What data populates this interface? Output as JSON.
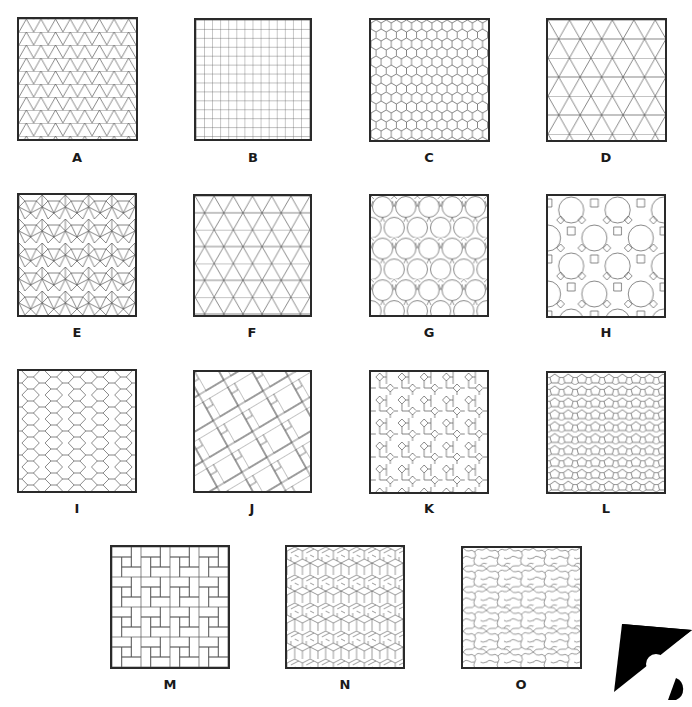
{
  "figure": {
    "title": "",
    "panels": [
      {
        "id": "A",
        "label": "A",
        "pattern": "triangular-grid-dense",
        "box": [
          17,
          17,
          121,
          124
        ]
      },
      {
        "id": "B",
        "label": "B",
        "pattern": "square-grid",
        "box": [
          194,
          18,
          118,
          123
        ]
      },
      {
        "id": "C",
        "label": "C",
        "pattern": "hexagonal",
        "box": [
          369,
          18,
          121,
          124
        ]
      },
      {
        "id": "D",
        "label": "D",
        "pattern": "trihexagonal-large",
        "box": [
          546,
          18,
          121,
          124
        ]
      },
      {
        "id": "E",
        "label": "E",
        "pattern": "snub-square",
        "box": [
          17,
          193,
          120,
          124
        ]
      },
      {
        "id": "F",
        "label": "F",
        "pattern": "trihexagonal",
        "box": [
          193,
          194,
          119,
          123
        ]
      },
      {
        "id": "G",
        "label": "G",
        "pattern": "truncated-hexagonal",
        "box": [
          369,
          194,
          120,
          123
        ]
      },
      {
        "id": "H",
        "label": "H",
        "pattern": "truncated-trihexagonal",
        "box": [
          546,
          194,
          120,
          124
        ]
      },
      {
        "id": "I",
        "label": "I",
        "pattern": "cairo-pentagonal",
        "box": [
          17,
          369,
          120,
          124
        ]
      },
      {
        "id": "J",
        "label": "J",
        "pattern": "pythagorean",
        "box": [
          193,
          370,
          119,
          123
        ]
      },
      {
        "id": "K",
        "label": "K",
        "pattern": "squares-and-crosses",
        "box": [
          369,
          370,
          120,
          124
        ]
      },
      {
        "id": "L",
        "label": "L",
        "pattern": "pentagon-dense",
        "box": [
          546,
          371,
          120,
          123
        ]
      },
      {
        "id": "M",
        "label": "M",
        "pattern": "basketweave",
        "box": [
          110,
          545,
          120,
          124
        ]
      },
      {
        "id": "N",
        "label": "N",
        "pattern": "interlocking-hexagonal",
        "box": [
          285,
          545,
          120,
          124
        ]
      },
      {
        "id": "O",
        "label": "O",
        "pattern": "curved-escher",
        "box": [
          461,
          546,
          121,
          123
        ]
      }
    ],
    "logo": {
      "name": "publisher-logo",
      "color": "#000000"
    }
  },
  "colors": {
    "line": "#555555",
    "border": "#2a2a2a",
    "background": "#ffffff"
  }
}
